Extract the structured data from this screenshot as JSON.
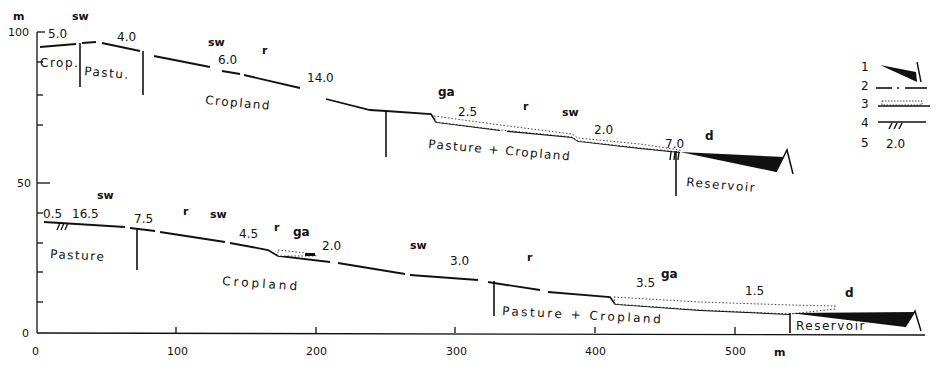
{
  "axes": {
    "y_unit": "m",
    "y_ticks": [
      "100",
      "50",
      "0"
    ],
    "x_ticks": [
      "0",
      "100",
      "200",
      "300",
      "400",
      "500"
    ],
    "x_unit": "m"
  },
  "upper_profile": {
    "slope_labels": [
      "5.0",
      "4.0",
      "6.0",
      "14.0",
      "2.5",
      "2.0",
      "7.0"
    ],
    "process_labels": [
      "sw",
      "sw",
      "r",
      "ga",
      "r",
      "sw",
      "d"
    ],
    "landuse": [
      "Crop.",
      "Pastu.",
      "Cropland",
      "Pasture + Cropland",
      "Reservoir"
    ]
  },
  "lower_profile": {
    "slope_labels": [
      "0.5",
      "16.5",
      "7.5",
      "4.5",
      "2.0",
      "3.0",
      "3.5",
      "1.5"
    ],
    "process_labels": [
      "sw",
      "r",
      "sw",
      "r",
      "ga",
      "sw",
      "r",
      "ga",
      "d"
    ],
    "landuse": [
      "Pasture",
      "Cropland",
      "Pasture + Cropland",
      "Reservoir"
    ]
  },
  "legend": {
    "items": [
      {
        "num": "1",
        "symbol": "reservoir-deposit-wedge"
      },
      {
        "num": "2",
        "symbol": "dash-dot-line"
      },
      {
        "num": "3",
        "symbol": "dotted-deposit-band"
      },
      {
        "num": "4",
        "symbol": "hatched-line"
      },
      {
        "num": "5",
        "symbol": "slope-value",
        "value": "2.0"
      }
    ]
  },
  "caption": {
    "text": "Fig. 4.10 Slope profiles ..."
  }
}
